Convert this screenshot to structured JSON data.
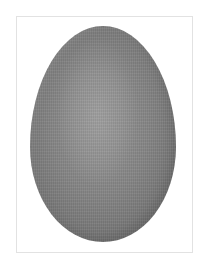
{
  "image": {
    "subject": "egg",
    "background_color": "#ffffff",
    "frame": {
      "border_color": "#e2e2e2",
      "fill_color": "#ffffff"
    },
    "egg": {
      "highlight_color": "#9a9a9a",
      "mid_color": "#8a8a8a",
      "edge_color": "#767676"
    }
  }
}
